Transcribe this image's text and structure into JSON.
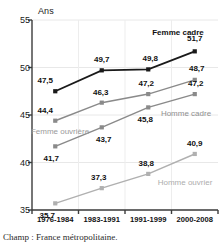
{
  "chart_data": {
    "type": "line",
    "title": "",
    "ylabel": "Ans",
    "xlabel": "",
    "ylim": [
      35,
      55
    ],
    "yticks": [
      35,
      40,
      45,
      50,
      55
    ],
    "grid": true,
    "legend_position": "inline-end-of-line",
    "categories": [
      "1976-1984",
      "1983-1991",
      "1991-1999",
      "2000-2008"
    ],
    "series": [
      {
        "name": "Femme cadre",
        "color": "#1a1a1a",
        "values": [
          47.5,
          49.7,
          49.8,
          51.7
        ],
        "labels": [
          "47,5",
          "49,7",
          "49,8",
          "51,7"
        ]
      },
      {
        "name": "Femme ouvrière",
        "color": "#8a8a8a",
        "values": [
          44.4,
          46.3,
          47.2,
          48.7
        ],
        "labels": [
          "44,4",
          "46,3",
          "47,2",
          "48,7"
        ]
      },
      {
        "name": "Homme cadre",
        "color": "#8a8a8a",
        "values": [
          41.7,
          43.7,
          45.8,
          47.2
        ],
        "labels": [
          "41,7",
          "43,7",
          "45,8",
          "47,2"
        ]
      },
      {
        "name": "Homme ouvrier",
        "color": "#b0b0b0",
        "values": [
          35.7,
          37.3,
          38.8,
          40.9
        ],
        "labels": [
          "35,7",
          "37,3",
          "38,8",
          "40,9"
        ]
      }
    ],
    "ytick_labels": [
      "35",
      "40",
      "45",
      "50",
      "55"
    ],
    "footnote": "Champ : France métropolitaine."
  },
  "axis": {
    "unit_label": "Ans"
  },
  "footnote": {
    "text": "Champ : France métropolitaine."
  }
}
